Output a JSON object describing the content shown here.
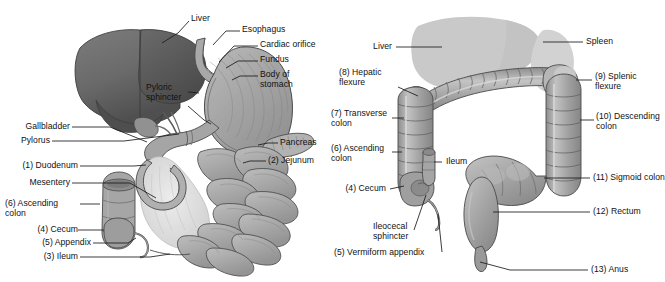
{
  "figure": {
    "background_color": "#ffffff",
    "text_color": "#111111",
    "leader_line_color": "#1a1a1a"
  },
  "left_diagram": {
    "name": "stomach-and-small-intestine",
    "organ_colors": {
      "liver": "#6f6f6f",
      "liver_shadow": "#565656",
      "gallbladder": "#8f8f8f",
      "stomach_outer": "#a5a5a5",
      "stomach_inner": "#b9b9b9",
      "pancreas": "#b0b0b0",
      "intestine": "#a8a8a8",
      "mesentery": "#dedede",
      "colon": "#9e9e9e",
      "outline": "#4a4a4a"
    },
    "labels": [
      {
        "id": "liver",
        "text": "Liver",
        "side": "top"
      },
      {
        "id": "esophagus",
        "text": "Esophagus",
        "side": "right"
      },
      {
        "id": "cardiac-orifice",
        "text": "Cardiac orifice",
        "side": "right"
      },
      {
        "id": "fundus",
        "text": "Fundus",
        "side": "right"
      },
      {
        "id": "body-of-stomach",
        "text": "Body of\nstomach",
        "side": "right"
      },
      {
        "id": "pyloric-sphincter",
        "text": "Pyloric\nsphincter",
        "side": "inner"
      },
      {
        "id": "pancreas",
        "text": "Pancreas",
        "side": "right"
      },
      {
        "id": "jejunum",
        "text": "(2) Jejunum",
        "side": "right"
      },
      {
        "id": "gallbladder",
        "text": "Gallbladder",
        "side": "left"
      },
      {
        "id": "pylorus",
        "text": "Pylorus",
        "side": "left"
      },
      {
        "id": "duodenum",
        "text": "(1) Duodenum",
        "side": "left"
      },
      {
        "id": "mesentery",
        "text": "Mesentery",
        "side": "left"
      },
      {
        "id": "ascending-colon",
        "text": "(6) Ascending\ncolon",
        "side": "left"
      },
      {
        "id": "cecum",
        "text": "(4) Cecum",
        "side": "left"
      },
      {
        "id": "appendix",
        "text": "(5) Appendix",
        "side": "left"
      },
      {
        "id": "ileum",
        "text": "(3) Ileum",
        "side": "left"
      }
    ]
  },
  "right_diagram": {
    "name": "large-intestine",
    "organ_colors": {
      "liver": "#c9c9c9",
      "spleen": "#d2d2d2",
      "colon": "#9a9a9a",
      "colon_light": "#b4b4b4",
      "colon_highlight": "#c6c6c6",
      "rectum": "#9a9a9a",
      "outline": "#4a4a4a"
    },
    "labels": [
      {
        "id": "liver",
        "text": "Liver",
        "side": "left"
      },
      {
        "id": "spleen",
        "text": "Spleen",
        "side": "right"
      },
      {
        "id": "hepatic-flexure",
        "text": "(8) Hepatic\nflexure",
        "side": "left"
      },
      {
        "id": "splenic-flexure",
        "text": "(9) Splenic\nflexure",
        "side": "right"
      },
      {
        "id": "transverse-colon",
        "text": "(7) Transverse\ncolon",
        "side": "left"
      },
      {
        "id": "descending-colon",
        "text": "(10) Descending\ncolon",
        "side": "right"
      },
      {
        "id": "ascending-colon",
        "text": "(6) Ascending\ncolon",
        "side": "left"
      },
      {
        "id": "ileum",
        "text": "Ileum",
        "side": "inner"
      },
      {
        "id": "cecum",
        "text": "(4) Cecum",
        "side": "left"
      },
      {
        "id": "sigmoid-colon",
        "text": "(11) Sigmoid colon",
        "side": "right"
      },
      {
        "id": "ileocecal-sphincter",
        "text": "Ileocecal\nsphincter",
        "side": "left"
      },
      {
        "id": "rectum",
        "text": "(12) Rectum",
        "side": "right"
      },
      {
        "id": "vermiform-appendix",
        "text": "(5) Vermiform appendix",
        "side": "left"
      },
      {
        "id": "anus",
        "text": "(13) Anus",
        "side": "right"
      }
    ]
  }
}
